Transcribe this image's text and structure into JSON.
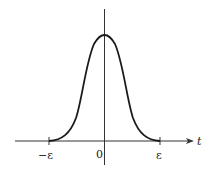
{
  "diagram": {
    "type": "bump-function-plot",
    "curve": "smooth bell-shaped bump supported on [-ε, ε]",
    "axes": {
      "x_label": "t",
      "ticks": [
        {
          "label": "−ε",
          "position": -1
        },
        {
          "label": "0",
          "position": 0
        },
        {
          "label": "ε",
          "position": 1
        }
      ]
    },
    "colors": {
      "stroke": "#1a1a1a",
      "axis": "#333333"
    }
  }
}
